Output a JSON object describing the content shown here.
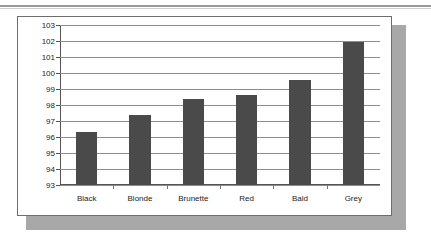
{
  "chart_data": {
    "type": "bar",
    "title": "",
    "subtitle": "",
    "xlabel": "",
    "ylabel": "",
    "categories": [
      "Black",
      "Blonde",
      "Brunette",
      "Red",
      "Bald",
      "Grey"
    ],
    "values": [
      96.3,
      97.4,
      98.35,
      98.65,
      99.55,
      101.95
    ],
    "series": [
      {
        "name": "",
        "values": [
          96.3,
          97.4,
          98.35,
          98.65,
          99.55,
          101.95
        ]
      }
    ],
    "ylim": [
      93,
      103
    ],
    "ytick_step": 1,
    "ytick_labels": [
      "103",
      "102",
      "101",
      "100",
      "99",
      "98",
      "97",
      "96",
      "95",
      "94",
      "93"
    ],
    "ytick_values": [
      103,
      102,
      101,
      100,
      99,
      98,
      97,
      96,
      95,
      94,
      93
    ],
    "grid": true,
    "grid_axis": "y",
    "legend": false,
    "legend_position": "none",
    "annotations": [],
    "colors": {
      "bar": "#4a4a4a",
      "gridline": "#8c8c8c",
      "axis": "#555555",
      "panel_background": "#ffffff",
      "panel_border": "#6d6d6d",
      "panel_shadow": "#a8a8a8",
      "text": "#1c1c1c"
    }
  }
}
